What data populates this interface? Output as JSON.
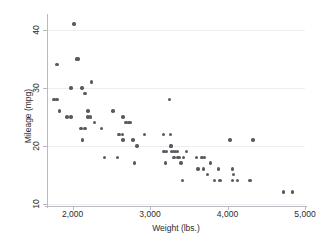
{
  "chart_data": {
    "type": "scatter",
    "title": "",
    "xlabel": "Weight (lbs.)",
    "ylabel": "Mileage (mpg)",
    "xlim": [
      1670,
      5000
    ],
    "ylim": [
      9.6,
      42.4
    ],
    "xticks": [
      2000,
      3000,
      4000,
      5000
    ],
    "xtick_labels": [
      "2,000",
      "3,000",
      "4,000",
      "5,000"
    ],
    "yticks": [
      10,
      20,
      30,
      40
    ],
    "ytick_labels": [
      "10",
      "20",
      "30",
      "40"
    ],
    "grid": "horizontal",
    "legend": "none",
    "marker_color": "#5a5a5f",
    "background_color": "#ffffff",
    "gridline_color": "#eceef0",
    "axis_color": "#b8bcc0",
    "points": [
      [
        1760,
        28
      ],
      [
        1800,
        28
      ],
      [
        1800,
        34
      ],
      [
        1830,
        26
      ],
      [
        1930,
        25
      ],
      [
        1980,
        25
      ],
      [
        1980,
        30
      ],
      [
        2020,
        41
      ],
      [
        2050,
        35
      ],
      [
        2070,
        35
      ],
      [
        2110,
        23
      ],
      [
        2120,
        30
      ],
      [
        2160,
        29
      ],
      [
        2160,
        23
      ],
      [
        2130,
        21
      ],
      [
        2200,
        25
      ],
      [
        2200,
        26
      ],
      [
        2230,
        25
      ],
      [
        2240,
        31
      ],
      [
        2280,
        24
      ],
      [
        2370,
        23
      ],
      [
        2410,
        18
      ],
      [
        2520,
        26
      ],
      [
        2580,
        18
      ],
      [
        2600,
        22
      ],
      [
        2640,
        22
      ],
      [
        2650,
        25
      ],
      [
        2650,
        21
      ],
      [
        2690,
        24
      ],
      [
        2730,
        24
      ],
      [
        2750,
        24
      ],
      [
        2780,
        21
      ],
      [
        2800,
        17
      ],
      [
        2830,
        20
      ],
      [
        2930,
        22
      ],
      [
        3170,
        22
      ],
      [
        3180,
        19
      ],
      [
        3200,
        17
      ],
      [
        3210,
        19
      ],
      [
        3250,
        28
      ],
      [
        3260,
        20
      ],
      [
        3260,
        22
      ],
      [
        3280,
        20
      ],
      [
        3280,
        19
      ],
      [
        3300,
        19
      ],
      [
        3310,
        18
      ],
      [
        3330,
        19
      ],
      [
        3350,
        18
      ],
      [
        3350,
        19
      ],
      [
        3370,
        18
      ],
      [
        3380,
        18
      ],
      [
        3400,
        17
      ],
      [
        3420,
        14
      ],
      [
        3430,
        18
      ],
      [
        3470,
        19
      ],
      [
        3600,
        18
      ],
      [
        3620,
        16
      ],
      [
        3670,
        18
      ],
      [
        3690,
        16
      ],
      [
        3700,
        18
      ],
      [
        3740,
        15
      ],
      [
        3780,
        17
      ],
      [
        3830,
        14
      ],
      [
        3880,
        16
      ],
      [
        3900,
        14
      ],
      [
        4030,
        21
      ],
      [
        4060,
        16
      ],
      [
        4060,
        14
      ],
      [
        4080,
        15
      ],
      [
        4130,
        14
      ],
      [
        4290,
        14
      ],
      [
        4330,
        21
      ],
      [
        4720,
        12
      ],
      [
        4840,
        12
      ]
    ]
  }
}
